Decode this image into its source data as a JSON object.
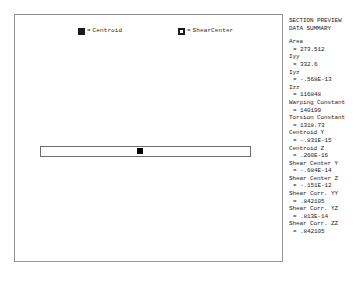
{
  "plot": {
    "legend": [
      {
        "marker": "filled-square-marker",
        "equals": "=",
        "label": "Centroid"
      },
      {
        "marker": "hollow-square-marker",
        "equals": "=",
        "label": "ShearCenter"
      }
    ],
    "shape": {
      "name": "rectangular-cross-section",
      "centroid_marker": "centroid-point"
    }
  },
  "panel": {
    "title_line_1": "SECTION PREVIEW",
    "title_line_2": "DATA SUMMARY",
    "items": [
      {
        "label": "Area",
        "value": "= 273.512"
      },
      {
        "label": "Iyy",
        "value": "= 332.6"
      },
      {
        "label": "Iyz",
        "value": "= -.568E-13"
      },
      {
        "label": "Izz",
        "value": "= 116848"
      },
      {
        "label": "Warping Constant",
        "value": "= 140199"
      },
      {
        "label": "Torsion Constant",
        "value": "= 1318.73"
      },
      {
        "label": "Centroid Y",
        "value": "= -.831E-15"
      },
      {
        "label": "Centroid Z",
        "value": "= .260E-16"
      },
      {
        "label": "Shear Center Y",
        "value": "= -.684E-14"
      },
      {
        "label": "Shear Center Z",
        "value": "= -.151E-12"
      },
      {
        "label": "Shear Corr. YY",
        "value": "= .842105"
      },
      {
        "label": "Shear Corr. YZ",
        "value": "= .813E-14"
      },
      {
        "label": "Shear Corr. ZZ",
        "value": "= .842105"
      }
    ]
  }
}
